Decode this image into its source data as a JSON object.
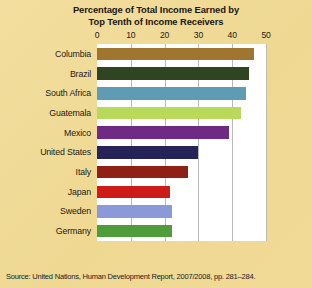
{
  "title": {
    "line1": "Percentage of Total Income Earned by",
    "line2": "Top Tenth of Income Receivers"
  },
  "source": "Source: United Nations, Human Development Report, 2007/2008, pp. 281–284.",
  "chart_data": {
    "type": "bar",
    "orientation": "horizontal",
    "title": "Percentage of Total Income Earned by Top Tenth of Income Receivers",
    "xlabel": "",
    "ylabel": "",
    "xlim": [
      0,
      50
    ],
    "ticks": [
      "0",
      "10",
      "20",
      "30",
      "40",
      "50"
    ],
    "tick_values": [
      0,
      10,
      20,
      30,
      40,
      50
    ],
    "grid": true,
    "legend": "none",
    "categories": [
      "Columbia",
      "Brazil",
      "South Africa",
      "Guatemala",
      "Mexico",
      "United States",
      "Italy",
      "Japan",
      "Sweden",
      "Germany"
    ],
    "values": [
      46.5,
      45.0,
      44.0,
      42.5,
      39.0,
      29.9,
      26.8,
      21.7,
      22.2,
      22.1
    ],
    "colors": [
      "#a0752f",
      "#2f4420",
      "#5f9cb4",
      "#b9d95b",
      "#6f2b83",
      "#262359",
      "#8e2016",
      "#cd1c17",
      "#8a9ad8",
      "#4f9c3b"
    ],
    "plot_background": "#ffffff",
    "page_background": "#f0da96",
    "gridline_color": "#b9b9b9"
  }
}
